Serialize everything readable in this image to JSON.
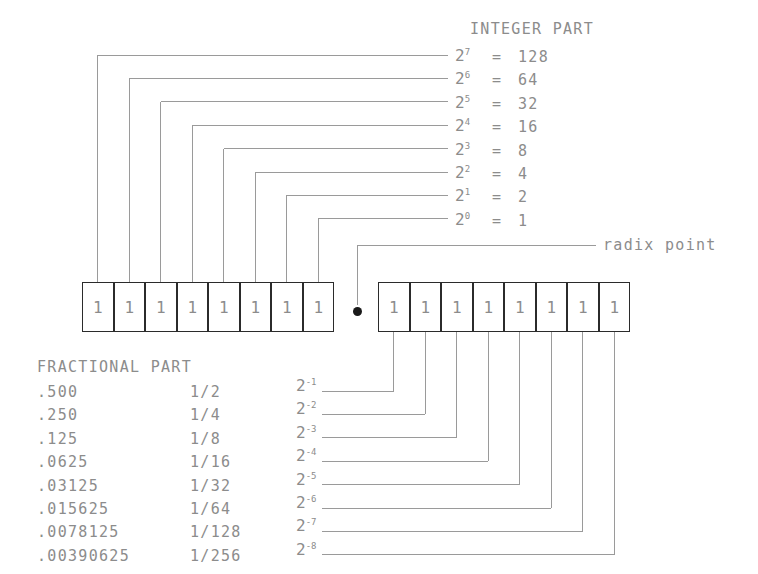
{
  "diagram": {
    "headings": {
      "integer_part": "INTEGER PART",
      "fractional_part": "FRACTIONAL PART",
      "radix_point": "radix point"
    },
    "colors": {
      "text": "#8c8c8c",
      "box_border": "#2b2b2b",
      "leader_line": "#9a9a9a",
      "radix_dot": "#1a1a1a",
      "background": "#ffffff"
    },
    "integer_rows": [
      {
        "base": "2",
        "exp": "7",
        "eq": "=",
        "value": "128"
      },
      {
        "base": "2",
        "exp": "6",
        "eq": "=",
        "value": "64"
      },
      {
        "base": "2",
        "exp": "5",
        "eq": "=",
        "value": "32"
      },
      {
        "base": "2",
        "exp": "4",
        "eq": "=",
        "value": "16"
      },
      {
        "base": "2",
        "exp": "3",
        "eq": "=",
        "value": "8"
      },
      {
        "base": "2",
        "exp": "2",
        "eq": "=",
        "value": "4"
      },
      {
        "base": "2",
        "exp": "1",
        "eq": "=",
        "value": "2"
      },
      {
        "base": "2",
        "exp": "0",
        "eq": "=",
        "value": "1"
      }
    ],
    "fraction_rows": [
      {
        "decimal": ".500",
        "fraction": "1/2",
        "base": "2",
        "exp": "-1"
      },
      {
        "decimal": ".250",
        "fraction": "1/4",
        "base": "2",
        "exp": "-2"
      },
      {
        "decimal": ".125",
        "fraction": "1/8",
        "base": "2",
        "exp": "-3"
      },
      {
        "decimal": ".0625",
        "fraction": "1/16",
        "base": "2",
        "exp": "-4"
      },
      {
        "decimal": ".03125",
        "fraction": "1/32",
        "base": "2",
        "exp": "-5"
      },
      {
        "decimal": ".015625",
        "fraction": "1/64",
        "base": "2",
        "exp": "-6"
      },
      {
        "decimal": ".0078125",
        "fraction": "1/128",
        "base": "2",
        "exp": "-7"
      },
      {
        "decimal": ".00390625",
        "fraction": "1/256",
        "base": "2",
        "exp": "-8"
      }
    ],
    "integer_bits": [
      "1",
      "1",
      "1",
      "1",
      "1",
      "1",
      "1",
      "1"
    ],
    "fraction_bits": [
      "1",
      "1",
      "1",
      "1",
      "1",
      "1",
      "1",
      "1"
    ]
  }
}
